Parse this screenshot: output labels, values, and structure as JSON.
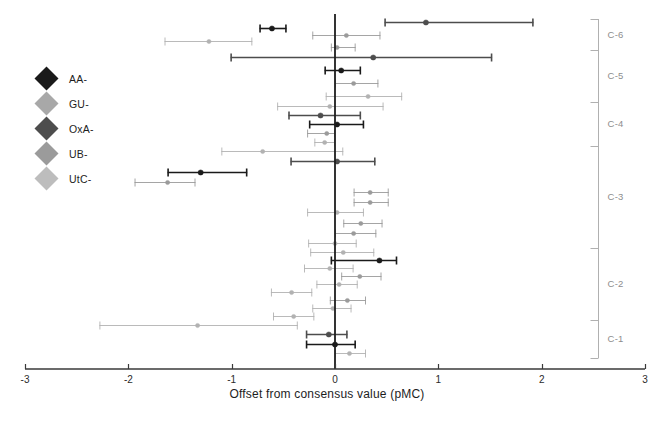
{
  "chart_data": {
    "type": "scatter",
    "orientation": "horizontal-errorbar",
    "title": "",
    "xlabel": "Offset from consensus value (pMC)",
    "ylabel": "",
    "xlim": [
      -3,
      3
    ],
    "xticks": [
      -3,
      -2,
      -1,
      0,
      1,
      2,
      3
    ],
    "xtick_labels": [
      "-3",
      "-2",
      "-1",
      "0",
      "1",
      "2",
      "3"
    ],
    "grid": false,
    "reference_line": 0,
    "legend_position": "left-inside",
    "legend": [
      {
        "name": "AA-",
        "color": "#1a1a1a"
      },
      {
        "name": "GU-",
        "color": "#a8a8a8"
      },
      {
        "name": "OxA-",
        "color": "#4d4d4d"
      },
      {
        "name": "UB-",
        "color": "#9b9b9b"
      },
      {
        "name": "UtC-",
        "color": "#bdbdbd"
      }
    ],
    "groups": [
      {
        "name": "C-6",
        "label": "C-6"
      },
      {
        "name": "C-5",
        "label": "C-5"
      },
      {
        "name": "C-4",
        "label": "C-4"
      },
      {
        "name": "C-3",
        "label": "C-3"
      },
      {
        "name": "C-2",
        "label": "C-2"
      },
      {
        "name": "C-1",
        "label": "C-1"
      }
    ],
    "series_note": "Each point is a laboratory offset with 1-sigma error bars",
    "points": [
      {
        "group": "C-6",
        "lab": "AA-",
        "x": 0.88,
        "xlo": 0.48,
        "xhi": 1.92,
        "color": "#4d4d4d"
      },
      {
        "group": "C-6",
        "lab": "OxA-",
        "x": -0.61,
        "xlo": -0.73,
        "xhi": -0.47,
        "color": "#1a1a1a"
      },
      {
        "group": "C-6",
        "lab": "GU-",
        "x": 0.11,
        "xlo": -0.22,
        "xhi": 0.44,
        "color": "#9b9b9b"
      },
      {
        "group": "C-6",
        "lab": "UtC-",
        "x": -1.22,
        "xlo": -1.65,
        "xhi": -0.8,
        "color": "#b2b2b2"
      },
      {
        "group": "C-6",
        "lab": "UB-",
        "x": 0.02,
        "xlo": -0.04,
        "xhi": 0.2,
        "color": "#9b9b9b"
      },
      {
        "group": "C-5",
        "lab": "AA-",
        "x": 0.37,
        "xlo": -1.01,
        "xhi": 1.52,
        "color": "#4d4d4d"
      },
      {
        "group": "C-5",
        "lab": "OxA-",
        "x": 0.06,
        "xlo": -0.1,
        "xhi": 0.25,
        "color": "#1a1a1a"
      },
      {
        "group": "C-5",
        "lab": "GU-",
        "x": 0.18,
        "xlo": 0.0,
        "xhi": 0.42,
        "color": "#9b9b9b"
      },
      {
        "group": "C-5",
        "lab": "UtC-",
        "x": 0.32,
        "xlo": -0.09,
        "xhi": 0.65,
        "color": "#b2b2b2"
      },
      {
        "group": "C-4",
        "lab": "GU-",
        "x": -0.05,
        "xlo": -0.56,
        "xhi": 0.47,
        "color": "#b2b2b2"
      },
      {
        "group": "C-4",
        "lab": "OxA-",
        "x": -0.14,
        "xlo": -0.45,
        "xhi": 0.25,
        "color": "#4d4d4d"
      },
      {
        "group": "C-4",
        "lab": "AA-",
        "x": 0.02,
        "xlo": -0.25,
        "xhi": 0.28,
        "color": "#1a1a1a"
      },
      {
        "group": "C-4",
        "lab": "UB-",
        "x": -0.08,
        "xlo": -0.27,
        "xhi": 0.0,
        "color": "#9b9b9b"
      },
      {
        "group": "C-4",
        "lab": "UtC-",
        "x": -0.1,
        "xlo": -0.2,
        "xhi": 0.0,
        "color": "#b2b2b2"
      },
      {
        "group": "C-3",
        "lab": "GU-",
        "x": -0.7,
        "xlo": -1.1,
        "xhi": 0.08,
        "color": "#b2b2b2"
      },
      {
        "group": "C-3",
        "lab": "AA-",
        "x": 0.02,
        "xlo": -0.43,
        "xhi": 0.39,
        "color": "#4d4d4d"
      },
      {
        "group": "C-3",
        "lab": "OxA-",
        "x": -1.3,
        "xlo": -1.62,
        "xhi": -0.85,
        "color": "#1a1a1a"
      },
      {
        "group": "C-3",
        "lab": "UtC-",
        "x": -1.62,
        "xlo": -1.94,
        "xhi": -1.35,
        "color": "#9b9b9b"
      },
      {
        "group": "C-3",
        "lab": "UB-",
        "x": 0.34,
        "xlo": 0.18,
        "xhi": 0.52,
        "color": "#9b9b9b"
      },
      {
        "group": "C-3",
        "lab": "UB-",
        "x": 0.34,
        "xlo": 0.18,
        "xhi": 0.52,
        "color": "#9b9b9b"
      },
      {
        "group": "C-3",
        "lab": "GU-",
        "x": 0.02,
        "xlo": -0.27,
        "xhi": 0.28,
        "color": "#b2b2b2"
      },
      {
        "group": "C-3",
        "lab": "UtC-",
        "x": 0.25,
        "xlo": 0.08,
        "xhi": 0.46,
        "color": "#9b9b9b"
      },
      {
        "group": "C-3",
        "lab": "UB-",
        "x": 0.18,
        "xlo": 0.0,
        "xhi": 0.4,
        "color": "#9b9b9b"
      },
      {
        "group": "C-3",
        "lab": "GU-",
        "x": 0.0,
        "xlo": -0.26,
        "xhi": 0.21,
        "color": "#b2b2b2"
      },
      {
        "group": "C-2",
        "lab": "GU-",
        "x": 0.08,
        "xlo": -0.24,
        "xhi": 0.38,
        "color": "#b2b2b2"
      },
      {
        "group": "C-2",
        "lab": "AA-",
        "x": 0.43,
        "xlo": -0.04,
        "xhi": 0.6,
        "color": "#1a1a1a"
      },
      {
        "group": "C-2",
        "lab": "UtC-",
        "x": -0.05,
        "xlo": -0.3,
        "xhi": 0.18,
        "color": "#b2b2b2"
      },
      {
        "group": "C-2",
        "lab": "UB-",
        "x": 0.24,
        "xlo": 0.06,
        "xhi": 0.45,
        "color": "#9b9b9b"
      },
      {
        "group": "C-2",
        "lab": "GU-",
        "x": 0.04,
        "xlo": -0.18,
        "xhi": 0.22,
        "color": "#b2b2b2"
      },
      {
        "group": "C-2",
        "lab": "UtC-",
        "x": -0.42,
        "xlo": -0.62,
        "xhi": -0.22,
        "color": "#b2b2b2"
      },
      {
        "group": "C-2",
        "lab": "UB-",
        "x": 0.12,
        "xlo": -0.05,
        "xhi": 0.3,
        "color": "#9b9b9b"
      },
      {
        "group": "C-2",
        "lab": "GU-",
        "x": -0.02,
        "xlo": -0.22,
        "xhi": 0.16,
        "color": "#b2b2b2"
      },
      {
        "group": "C-2",
        "lab": "UtC-",
        "x": -0.4,
        "xlo": -0.6,
        "xhi": -0.2,
        "color": "#b2b2b2"
      },
      {
        "group": "C-1",
        "lab": "GU-",
        "x": -1.33,
        "xlo": -2.28,
        "xhi": -0.36,
        "color": "#b2b2b2"
      },
      {
        "group": "C-1",
        "lab": "OxA-",
        "x": -0.06,
        "xlo": -0.28,
        "xhi": 0.12,
        "color": "#4d4d4d"
      },
      {
        "group": "C-1",
        "lab": "AA-",
        "x": 0.0,
        "xlo": -0.28,
        "xhi": 0.2,
        "color": "#1a1a1a"
      },
      {
        "group": "C-1",
        "lab": "UtC-",
        "x": 0.14,
        "xlo": 0.0,
        "xhi": 0.3,
        "color": "#b2b2b2"
      }
    ]
  },
  "axis": {
    "x_title": "Offset from consensus value (pMC)",
    "tick_labels": [
      "-3",
      "-2",
      "-1",
      "0",
      "1",
      "2",
      "3"
    ]
  },
  "legend": {
    "items": [
      {
        "label": "AA-",
        "color": "#1a1a1a"
      },
      {
        "label": "GU-",
        "color": "#a8a8a8"
      },
      {
        "label": "OxA-",
        "color": "#4d4d4d"
      },
      {
        "label": "UB-",
        "color": "#9b9b9b"
      },
      {
        "label": "UtC-",
        "color": "#bdbdbd"
      }
    ]
  },
  "groups": {
    "labels": [
      "C-6",
      "C-5",
      "C-4",
      "C-3",
      "C-2",
      "C-1"
    ]
  },
  "colors": {
    "axis": "#3a3a3a",
    "reference_line": "#1d1d1d",
    "bracket": "#b0b0b0",
    "group_text": "#8d8d8d"
  }
}
